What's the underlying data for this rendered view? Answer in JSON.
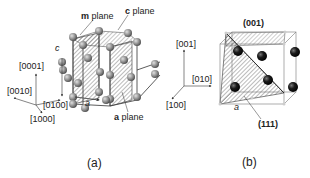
{
  "panel_a": {
    "caption": "(a)",
    "structure": "hexagonal",
    "labels": {
      "m_plane_letter": "m",
      "m_plane_word": "plane",
      "c_plane_letter": "c",
      "c_plane_word": "plane",
      "a_plane_letter": "a",
      "a_plane_word": "plane",
      "c_axis": "c",
      "a_axis": "a"
    },
    "axes": [
      "[0001]",
      "[0010]",
      "[0100]",
      "[1000]"
    ]
  },
  "panel_b": {
    "caption": "(b)",
    "structure": "cubic",
    "labels": {
      "top_plane": "(001)",
      "diag_plane": "(111)",
      "a_axis": "a"
    },
    "axes": [
      "[001]",
      "[010]",
      "[100]"
    ]
  },
  "colors": {
    "line": "#333333",
    "hatch": "#555555",
    "atom_a": "#8a8a8a",
    "atom_b": "#111111"
  }
}
